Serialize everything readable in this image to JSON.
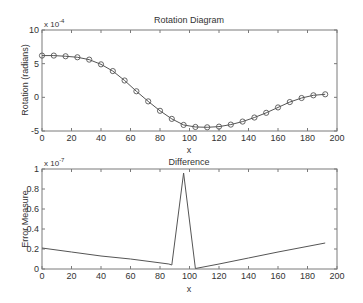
{
  "chart_data": [
    {
      "type": "line",
      "title": "Rotation Diagram",
      "xlabel": "x",
      "ylabel": "Rotation (radians)",
      "y_exponent_label": "x 10",
      "y_exponent_power": "-4",
      "xlim": [
        0,
        200
      ],
      "ylim": [
        -5,
        10
      ],
      "xticks": [
        0,
        20,
        40,
        60,
        80,
        100,
        120,
        140,
        160,
        180,
        200
      ],
      "yticks": [
        -5,
        0,
        5,
        10
      ],
      "grid": false,
      "markers": "circle",
      "x": [
        0,
        8,
        16,
        24,
        32,
        40,
        48,
        56,
        64,
        72,
        80,
        88,
        96,
        104,
        112,
        120,
        128,
        136,
        144,
        152,
        160,
        168,
        176,
        184,
        192
      ],
      "y": [
        6.2,
        6.2,
        6.1,
        5.95,
        5.6,
        4.9,
        3.9,
        2.5,
        0.9,
        -0.6,
        -2.0,
        -3.2,
        -4.1,
        -4.4,
        -4.45,
        -4.35,
        -4.05,
        -3.6,
        -3.0,
        -2.3,
        -1.5,
        -0.7,
        -0.1,
        0.3,
        0.45
      ]
    },
    {
      "type": "line",
      "title": "Difference",
      "xlabel": "x",
      "ylabel": "Error Measure",
      "y_exponent_label": "x 10",
      "y_exponent_power": "-7",
      "xlim": [
        0,
        200
      ],
      "ylim": [
        0,
        1
      ],
      "xticks": [
        0,
        20,
        40,
        60,
        80,
        100,
        120,
        140,
        160,
        180,
        200
      ],
      "yticks": [
        0,
        0.2,
        0.4,
        0.6,
        0.8,
        1
      ],
      "ytick_labels": [
        "0",
        "0.2",
        "0.4",
        "0.6",
        "0.8",
        "1"
      ],
      "grid": false,
      "markers": "none",
      "x": [
        0,
        20,
        40,
        60,
        86,
        88,
        96,
        104,
        120,
        140,
        160,
        192
      ],
      "y": [
        0.21,
        0.17,
        0.13,
        0.1,
        0.05,
        0.04,
        0.96,
        0.005,
        0.05,
        0.11,
        0.17,
        0.26
      ]
    }
  ]
}
